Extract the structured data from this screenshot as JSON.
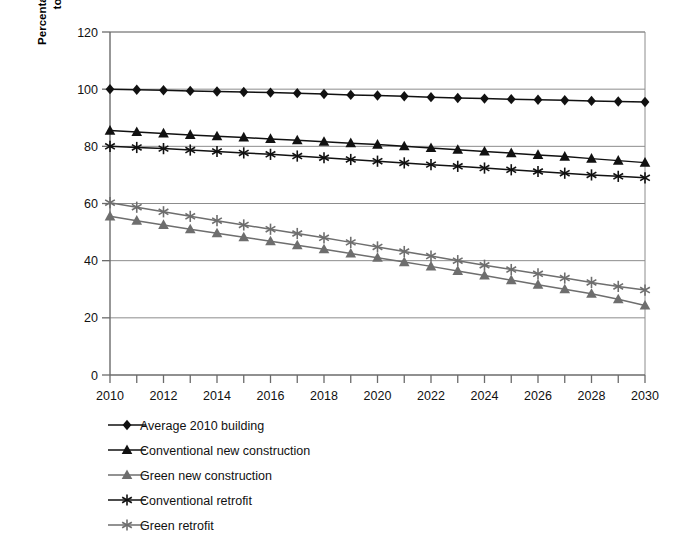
{
  "chart_data": {
    "type": "line",
    "title": "",
    "xlabel": "",
    "ylabel_line1": "Percentage of energy use in comparison",
    "ylabel_line2": "to an average 2010 building",
    "xlim": [
      2010,
      2030
    ],
    "ylim": [
      0,
      120
    ],
    "ytick_values": [
      0,
      20,
      40,
      60,
      80,
      100,
      120
    ],
    "ytick_labels": [
      "0",
      "20",
      "40",
      "60",
      "80",
      "100",
      "120"
    ],
    "xtick_values": [
      2010,
      2011,
      2012,
      2013,
      2014,
      2015,
      2016,
      2017,
      2018,
      2019,
      2020,
      2021,
      2022,
      2023,
      2024,
      2025,
      2026,
      2027,
      2028,
      2029,
      2030
    ],
    "xtick_labels_shown": [
      "2010",
      "2012",
      "2014",
      "2016",
      "2018",
      "2020",
      "2022",
      "2024",
      "2026",
      "2028",
      "2030"
    ],
    "grid": "horizontal",
    "legend_position": "below-left",
    "x": [
      2010,
      2011,
      2012,
      2013,
      2014,
      2015,
      2016,
      2017,
      2018,
      2019,
      2020,
      2021,
      2022,
      2023,
      2024,
      2025,
      2026,
      2027,
      2028,
      2029,
      2030
    ],
    "series": [
      {
        "name": "Average 2010 building",
        "marker": "diamond",
        "color": "#111111",
        "values": [
          100.0,
          99.8,
          99.6,
          99.4,
          99.2,
          99.0,
          98.8,
          98.6,
          98.3,
          98.0,
          97.8,
          97.5,
          97.2,
          96.9,
          96.7,
          96.5,
          96.3,
          96.1,
          95.9,
          95.7,
          95.5
        ]
      },
      {
        "name": "Conventional new construction",
        "marker": "triangle",
        "color": "#111111",
        "values": [
          85.5,
          85.0,
          84.5,
          84.0,
          83.5,
          83.1,
          82.6,
          82.1,
          81.6,
          81.1,
          80.6,
          80.0,
          79.4,
          78.8,
          78.2,
          77.6,
          77.0,
          76.4,
          75.7,
          75.0,
          74.3
        ]
      },
      {
        "name": "Green new construction",
        "marker": "triangle",
        "color": "#6e6e6e",
        "values": [
          55.5,
          54.0,
          52.5,
          51.0,
          49.6,
          48.2,
          46.8,
          45.4,
          44.0,
          42.5,
          41.0,
          39.5,
          38.0,
          36.4,
          34.8,
          33.2,
          31.6,
          30.0,
          28.4,
          26.5,
          24.3
        ]
      },
      {
        "name": "Conventional retrofit",
        "marker": "asterisk",
        "color": "#111111",
        "values": [
          80.0,
          79.6,
          79.2,
          78.7,
          78.2,
          77.7,
          77.2,
          76.6,
          76.0,
          75.4,
          74.8,
          74.2,
          73.6,
          73.0,
          72.4,
          71.8,
          71.2,
          70.6,
          70.0,
          69.5,
          69.0
        ]
      },
      {
        "name": "Green retrofit",
        "marker": "asterisk",
        "color": "#6e6e6e",
        "values": [
          60.3,
          58.7,
          57.1,
          55.5,
          54.0,
          52.5,
          51.0,
          49.5,
          48.0,
          46.4,
          44.8,
          43.2,
          41.6,
          40.0,
          38.4,
          36.9,
          35.4,
          33.9,
          32.4,
          31.0,
          29.7
        ]
      }
    ]
  },
  "legend": {
    "items": [
      {
        "label": "Average 2010 building",
        "marker": "diamond-marker-icon",
        "color": "#111111"
      },
      {
        "label": "Conventional new construction",
        "marker": "triangle-marker-icon",
        "color": "#111111"
      },
      {
        "label": "Green new construction",
        "marker": "triangle-marker-icon",
        "color": "#6e6e6e"
      },
      {
        "label": "Conventional retrofit",
        "marker": "asterisk-marker-icon",
        "color": "#111111"
      },
      {
        "label": "Green retrofit",
        "marker": "asterisk-marker-icon",
        "color": "#6e6e6e"
      }
    ]
  }
}
